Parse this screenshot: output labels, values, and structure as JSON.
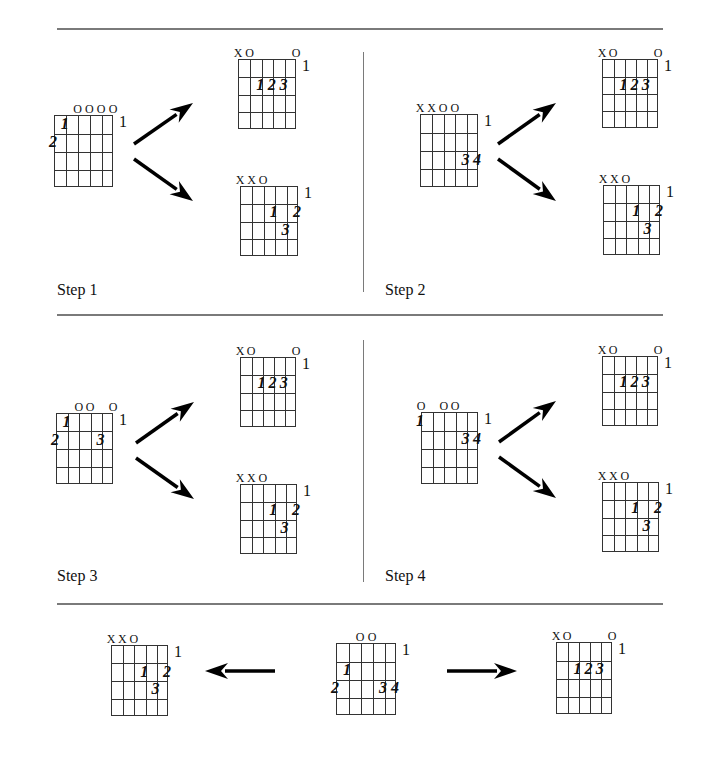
{
  "steps": [
    {
      "label": "Step 1",
      "x": 57,
      "y": 281
    },
    {
      "label": "Step 2",
      "x": 385,
      "y": 281
    },
    {
      "label": "Step 3",
      "x": 57,
      "y": 567
    },
    {
      "label": "Step 4",
      "x": 385,
      "y": 567
    }
  ],
  "rules": {
    "horizontal": [
      {
        "x1": 57,
        "x2": 663,
        "y": 28
      },
      {
        "x1": 57,
        "x2": 663,
        "y": 314
      },
      {
        "x1": 57,
        "x2": 663,
        "y": 603
      }
    ],
    "vertical": [
      {
        "x": 363,
        "y1": 52,
        "y2": 292
      },
      {
        "x": 363,
        "y1": 340,
        "y2": 582
      }
    ]
  },
  "chords": [
    {
      "id": "step1-g6",
      "name": "G6",
      "name_size": 14,
      "x": 54,
      "y": 115,
      "w": 59,
      "h": 72,
      "fret": "1",
      "marks": [
        "",
        "",
        "O",
        "O",
        "O",
        "O"
      ],
      "fingers": [
        {
          "string": 5,
          "fret": 1,
          "label": "1"
        },
        {
          "string": 6,
          "fret": 2,
          "label": "2"
        }
      ]
    },
    {
      "id": "step1-amaj",
      "name": "Amaj",
      "name_size": 10,
      "x": 238,
      "y": 59,
      "w": 58,
      "h": 70,
      "fret": "1",
      "marks": [
        "X",
        "O",
        "",
        "",
        "",
        "O"
      ],
      "fingers": [
        {
          "string": 4,
          "fret": 2,
          "label": "1"
        },
        {
          "string": 3,
          "fret": 2,
          "label": "2"
        },
        {
          "string": 2,
          "fret": 2,
          "label": "3"
        }
      ]
    },
    {
      "id": "step1-dmaj",
      "name": "Dmaj",
      "name_size": 10,
      "x": 240,
      "y": 186,
      "w": 58,
      "h": 70,
      "fret": "1",
      "marks": [
        "X",
        "X",
        "O",
        "",
        "",
        ""
      ],
      "fingers": [
        {
          "string": 3,
          "fret": 2,
          "label": "1"
        },
        {
          "string": 1,
          "fret": 2,
          "label": "2"
        },
        {
          "string": 2,
          "fret": 3,
          "label": "3"
        }
      ]
    },
    {
      "id": "step2-g5d",
      "name": "G5/D",
      "name_size": 14,
      "x": 420,
      "y": 114,
      "w": 58,
      "h": 73,
      "fret": "1",
      "marks": [
        "X",
        "X",
        "O",
        "O",
        "",
        ""
      ],
      "fingers": [
        {
          "string": 2,
          "fret": 3,
          "label": "3"
        },
        {
          "string": 1,
          "fret": 3,
          "label": "4"
        }
      ]
    },
    {
      "id": "step2-amaj",
      "name": "Amaj",
      "name_size": 10,
      "x": 602,
      "y": 59,
      "w": 56,
      "h": 69,
      "fret": "1",
      "marks": [
        "X",
        "O",
        "",
        "",
        "",
        "O"
      ],
      "fingers": [
        {
          "string": 4,
          "fret": 2,
          "label": "1"
        },
        {
          "string": 3,
          "fret": 2,
          "label": "2"
        },
        {
          "string": 2,
          "fret": 2,
          "label": "3"
        }
      ]
    },
    {
      "id": "step2-dmaj",
      "name": "Dmaj",
      "name_size": 10,
      "x": 603,
      "y": 185,
      "w": 57,
      "h": 70,
      "fret": "1",
      "marks": [
        "X",
        "X",
        "O",
        "",
        "",
        ""
      ],
      "fingers": [
        {
          "string": 3,
          "fret": 2,
          "label": "1"
        },
        {
          "string": 1,
          "fret": 2,
          "label": "2"
        },
        {
          "string": 2,
          "fret": 3,
          "label": "3"
        }
      ]
    },
    {
      "id": "step3-g6",
      "name": "G6",
      "name_size": 14,
      "x": 56,
      "y": 413,
      "w": 57,
      "h": 71,
      "fret": "1",
      "marks": [
        "",
        "",
        "O",
        "O",
        "",
        "O"
      ],
      "fingers": [
        {
          "string": 5,
          "fret": 1,
          "label": "1"
        },
        {
          "string": 6,
          "fret": 2,
          "label": "2"
        },
        {
          "string": 2,
          "fret": 2,
          "label": "3"
        }
      ]
    },
    {
      "id": "step3-amaj",
      "name": "Amaj",
      "name_size": 10,
      "x": 240,
      "y": 357,
      "w": 56,
      "h": 70,
      "fret": "1",
      "marks": [
        "X",
        "O",
        "",
        "",
        "",
        "O"
      ],
      "fingers": [
        {
          "string": 4,
          "fret": 2,
          "label": "1"
        },
        {
          "string": 3,
          "fret": 2,
          "label": "2"
        },
        {
          "string": 2,
          "fret": 2,
          "label": "3"
        }
      ]
    },
    {
      "id": "step3-dmaj",
      "name": "Dmaj",
      "name_size": 10,
      "x": 240,
      "y": 484,
      "w": 57,
      "h": 70,
      "fret": "1",
      "marks": [
        "X",
        "X",
        "O",
        "",
        "",
        ""
      ],
      "fingers": [
        {
          "string": 3,
          "fret": 2,
          "label": "1"
        },
        {
          "string": 1,
          "fret": 2,
          "label": "2"
        },
        {
          "string": 2,
          "fret": 3,
          "label": "3"
        }
      ]
    },
    {
      "id": "step4-em7",
      "name": "Em7",
      "name_size": 14,
      "x": 421,
      "y": 412,
      "w": 57,
      "h": 72,
      "fret": "1",
      "marks": [
        "O",
        "",
        "O",
        "O",
        "",
        ""
      ],
      "fingers": [
        {
          "string": 6,
          "fret": 1,
          "label": "1"
        },
        {
          "string": 2,
          "fret": 2,
          "label": "3"
        },
        {
          "string": 1,
          "fret": 2,
          "label": "4"
        }
      ]
    },
    {
      "id": "step4-amaj",
      "name": "Amaj",
      "name_size": 10,
      "x": 602,
      "y": 356,
      "w": 56,
      "h": 70,
      "fret": "1",
      "marks": [
        "X",
        "O",
        "",
        "",
        "",
        "O"
      ],
      "fingers": [
        {
          "string": 4,
          "fret": 2,
          "label": "1"
        },
        {
          "string": 3,
          "fret": 2,
          "label": "2"
        },
        {
          "string": 2,
          "fret": 2,
          "label": "3"
        }
      ]
    },
    {
      "id": "step4-dmaj",
      "name": "Dmaj",
      "name_size": 10,
      "x": 602,
      "y": 482,
      "w": 57,
      "h": 70,
      "fret": "1",
      "marks": [
        "X",
        "X",
        "O",
        "",
        "",
        ""
      ],
      "fingers": [
        {
          "string": 3,
          "fret": 2,
          "label": "1"
        },
        {
          "string": 1,
          "fret": 2,
          "label": "2"
        },
        {
          "string": 2,
          "fret": 3,
          "label": "3"
        }
      ]
    },
    {
      "id": "bottom-dmaj",
      "name": "Dmaj",
      "name_size": 10,
      "x": 111,
      "y": 645,
      "w": 57,
      "h": 71,
      "fret": "1",
      "marks": [
        "X",
        "X",
        "O",
        "",
        "",
        ""
      ],
      "fingers": [
        {
          "string": 3,
          "fret": 2,
          "label": "1"
        },
        {
          "string": 1,
          "fret": 2,
          "label": "2"
        },
        {
          "string": 2,
          "fret": 3,
          "label": "3"
        }
      ]
    },
    {
      "id": "bottom-gmaj",
      "name": "Gmaj",
      "name_size": 14,
      "x": 336,
      "y": 643,
      "w": 60,
      "h": 72,
      "fret": "1",
      "marks": [
        "",
        "",
        "O",
        "O",
        "",
        ""
      ],
      "fingers": [
        {
          "string": 5,
          "fret": 2,
          "label": "1"
        },
        {
          "string": 6,
          "fret": 3,
          "label": "2"
        },
        {
          "string": 2,
          "fret": 3,
          "label": "3"
        },
        {
          "string": 1,
          "fret": 3,
          "label": "4"
        }
      ]
    },
    {
      "id": "bottom-amaj",
      "name": "Amaj",
      "name_size": 10,
      "x": 556,
      "y": 642,
      "w": 56,
      "h": 72,
      "fret": "1",
      "marks": [
        "X",
        "O",
        "",
        "",
        "",
        "O"
      ],
      "fingers": [
        {
          "string": 4,
          "fret": 2,
          "label": "1"
        },
        {
          "string": 3,
          "fret": 2,
          "label": "2"
        },
        {
          "string": 2,
          "fret": 2,
          "label": "3"
        }
      ]
    }
  ],
  "arrows": [
    {
      "id": "step1-up",
      "x1": 134,
      "y1": 144,
      "x2": 193,
      "y2": 103
    },
    {
      "id": "step1-down",
      "x1": 134,
      "y1": 159,
      "x2": 193,
      "y2": 201
    },
    {
      "id": "step2-up",
      "x1": 498,
      "y1": 144,
      "x2": 556,
      "y2": 103
    },
    {
      "id": "step2-down",
      "x1": 498,
      "y1": 159,
      "x2": 556,
      "y2": 201
    },
    {
      "id": "step3-up",
      "x1": 136,
      "y1": 443,
      "x2": 194,
      "y2": 402
    },
    {
      "id": "step3-down",
      "x1": 136,
      "y1": 458,
      "x2": 194,
      "y2": 499
    },
    {
      "id": "step4-up",
      "x1": 499,
      "y1": 442,
      "x2": 556,
      "y2": 401
    },
    {
      "id": "step4-down",
      "x1": 499,
      "y1": 457,
      "x2": 556,
      "y2": 498
    },
    {
      "id": "bottom-left",
      "x1": 275,
      "y1": 671,
      "x2": 205,
      "y2": 671
    },
    {
      "id": "bottom-right",
      "x1": 447,
      "y1": 671,
      "x2": 517,
      "y2": 671
    }
  ],
  "colors": {
    "line": "#333333",
    "rule": "#7a7a7a",
    "text": "#111111"
  }
}
